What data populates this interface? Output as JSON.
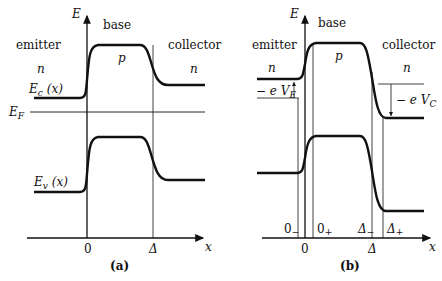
{
  "panels": [
    {
      "id": "a",
      "caption": "(a)",
      "axis_y_label": "E",
      "axis_x_label": "x",
      "regions": {
        "left": "emitter",
        "middle": "base",
        "right": "collector"
      },
      "doping": {
        "left": "n",
        "middle": "p",
        "right": "n"
      },
      "curve_labels": {
        "conduction": "E",
        "conduction_sub": "c",
        "conduction_arg": "(x)",
        "valence": "E",
        "valence_sub": "v",
        "valence_arg": "(x)",
        "fermi": "E",
        "fermi_sub": "F"
      },
      "x_ticks": [
        "0",
        "Δ"
      ]
    },
    {
      "id": "b",
      "caption": "(b)",
      "axis_y_label": "E",
      "axis_x_label": "x",
      "regions": {
        "left": "emitter",
        "middle": "base",
        "right": "collector"
      },
      "doping": {
        "left": "n",
        "middle": "p",
        "right": "n"
      },
      "bias_labels": {
        "emitter": "− e V",
        "emitter_sub": "E",
        "collector": "− e V",
        "collector_sub": "C"
      },
      "x_ticks": [
        "0",
        "Δ"
      ],
      "boundary_labels": {
        "zero_minus": "0",
        "zero_minus_sub": "−",
        "zero_plus": "0",
        "zero_plus_sub": "+",
        "delta_minus": "Δ",
        "delta_minus_sub": "−",
        "delta_plus": "Δ",
        "delta_plus_sub": "+"
      }
    }
  ]
}
